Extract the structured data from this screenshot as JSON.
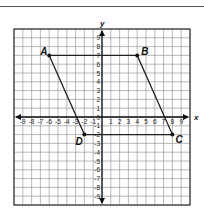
{
  "figure": {
    "type": "coordinate-plane",
    "x_axis_label": "x",
    "y_axis_label": "y",
    "x_range": [
      -10,
      10
    ],
    "y_range": [
      -10,
      10
    ],
    "x_ticks": [
      "-9",
      "-8",
      "-7",
      "-6",
      "-5",
      "-4",
      "-3",
      "-2",
      "-1",
      "0",
      "1",
      "2",
      "3",
      "4",
      "5",
      "6",
      "7",
      "8",
      "9"
    ],
    "y_ticks": [
      "9",
      "8",
      "7",
      "6",
      "5",
      "4",
      "3",
      "2",
      "1",
      "0",
      "-1",
      "-2",
      "-3",
      "-4",
      "-5",
      "-6",
      "-7",
      "-8",
      "-9"
    ],
    "points": [
      {
        "label": "A",
        "x": -6,
        "y": 7
      },
      {
        "label": "B",
        "x": 4,
        "y": 7
      },
      {
        "label": "C",
        "x": 8,
        "y": -2
      },
      {
        "label": "D",
        "x": -2,
        "y": -2
      }
    ],
    "polygon": [
      "A",
      "B",
      "C",
      "D"
    ],
    "colors": {
      "grid": "#8a8a8a",
      "axis": "#111111",
      "shape": "#222222",
      "border": "#333333"
    }
  }
}
